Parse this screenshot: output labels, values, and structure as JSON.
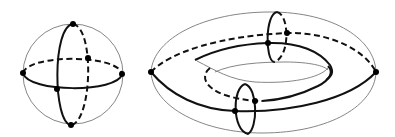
{
  "figure": {
    "description": "Curves on a sphere and a torus",
    "colors": {
      "background": "#ffffff",
      "surface_outline": "#777777",
      "curve": "#111111",
      "point": "#000000"
    },
    "sphere": {
      "label": "sphere",
      "outline": {
        "cx": 73,
        "cy": 74,
        "r": 50
      },
      "meridian": {
        "cx": 72,
        "cy": 74,
        "rx": 17,
        "ry": 51
      },
      "equator": {
        "cx": 73,
        "cy": 74,
        "rx": 50,
        "ry": 15
      },
      "points": [
        {
          "name": "top",
          "x": 73,
          "y": 24
        },
        {
          "name": "bottom",
          "x": 71,
          "y": 125
        },
        {
          "name": "left",
          "x": 23,
          "y": 73
        },
        {
          "name": "right",
          "x": 122,
          "y": 74
        },
        {
          "name": "front-crossing",
          "x": 57,
          "y": 89
        },
        {
          "name": "back-crossing",
          "x": 88,
          "y": 58
        }
      ]
    },
    "torus": {
      "label": "torus",
      "outer": {
        "cx": 264,
        "cy": 72,
        "rx": 113,
        "ry": 61
      },
      "points": [
        {
          "name": "left-apex",
          "x": 151,
          "y": 72
        },
        {
          "name": "right-apex",
          "x": 376,
          "y": 72
        },
        {
          "name": "upper-tube-front",
          "x": 268,
          "y": 43
        },
        {
          "name": "upper-tube-back",
          "x": 287,
          "y": 33
        },
        {
          "name": "lower-tube-front",
          "x": 235,
          "y": 111
        },
        {
          "name": "lower-tube-back",
          "x": 255,
          "y": 101
        }
      ],
      "tube_circles": [
        {
          "name": "upper",
          "cx": 277,
          "cy": 37,
          "rx": 10,
          "ry": 25
        },
        {
          "name": "lower",
          "cx": 245,
          "cy": 109,
          "rx": 11,
          "ry": 25
        }
      ]
    }
  }
}
